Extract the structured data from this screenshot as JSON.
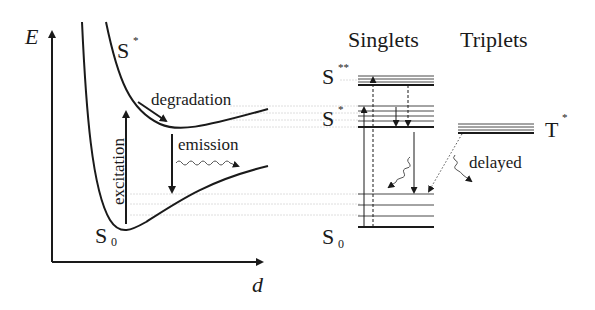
{
  "diagram": {
    "type": "Jablonski / potential energy diagram",
    "left_panel": {
      "y_axis_label": "E",
      "x_axis_label": "d",
      "curves": [
        {
          "name": "S*",
          "label_main": "S",
          "label_sup": "*"
        },
        {
          "name": "S0",
          "label_main": "S",
          "label_sub": "0"
        }
      ],
      "annotations": {
        "excitation": "excitation",
        "degradation": "degradation",
        "emission": "emission"
      }
    },
    "right_panel": {
      "column_headers": {
        "singlets": "Singlets",
        "triplets": "Triplets"
      },
      "levels": {
        "s2": {
          "main": "S",
          "sup": "**"
        },
        "s1": {
          "main": "S",
          "sup": "*"
        },
        "s0": {
          "main": "S",
          "sub": "0"
        },
        "t1": {
          "main": "T",
          "sup": "*"
        }
      },
      "annotations": {
        "delayed": "delayed"
      }
    },
    "colors": {
      "ink": "#1a1a1a",
      "guide": "#cfcfcf"
    }
  }
}
